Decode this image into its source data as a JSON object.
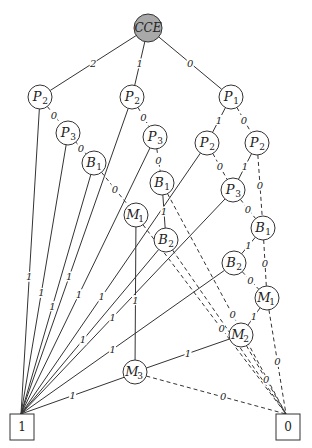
{
  "diagram": {
    "root": {
      "id": "CCE",
      "label": "CCE",
      "x": 148,
      "y": 28,
      "r": 14,
      "fill": "#a9a9a9"
    },
    "nodes": [
      {
        "id": "P2L",
        "base": "P",
        "sub": "2",
        "x": 40,
        "y": 97
      },
      {
        "id": "P2M",
        "base": "P",
        "sub": "2",
        "x": 132,
        "y": 97
      },
      {
        "id": "P1",
        "base": "P",
        "sub": "1",
        "x": 231,
        "y": 97
      },
      {
        "id": "P3L",
        "base": "P",
        "sub": "3",
        "x": 68,
        "y": 133
      },
      {
        "id": "P3M",
        "base": "P",
        "sub": "3",
        "x": 155,
        "y": 137
      },
      {
        "id": "P2a",
        "base": "P",
        "sub": "2",
        "x": 207,
        "y": 143
      },
      {
        "id": "P2b",
        "base": "P",
        "sub": "2",
        "x": 257,
        "y": 143
      },
      {
        "id": "B1L",
        "base": "B",
        "sub": "1",
        "x": 94,
        "y": 163
      },
      {
        "id": "B1M",
        "base": "B",
        "sub": "1",
        "x": 162,
        "y": 183
      },
      {
        "id": "P3R",
        "base": "P",
        "sub": "3",
        "x": 233,
        "y": 190
      },
      {
        "id": "M1L",
        "base": "M",
        "sub": "1",
        "x": 136,
        "y": 215
      },
      {
        "id": "B1R",
        "base": "B",
        "sub": "1",
        "x": 263,
        "y": 228
      },
      {
        "id": "B2M",
        "base": "B",
        "sub": "2",
        "x": 166,
        "y": 240
      },
      {
        "id": "B2R",
        "base": "B",
        "sub": "2",
        "x": 234,
        "y": 263
      },
      {
        "id": "M1R",
        "base": "M",
        "sub": "1",
        "x": 267,
        "y": 298
      },
      {
        "id": "M2",
        "base": "M",
        "sub": "2",
        "x": 241,
        "y": 335
      },
      {
        "id": "M3",
        "base": "M",
        "sub": "3",
        "x": 135,
        "y": 372
      }
    ],
    "node_radius": 12,
    "terminals": [
      {
        "id": "T1",
        "label": "1",
        "x": 22,
        "y": 427,
        "w": 24,
        "h": 26
      },
      {
        "id": "T0",
        "label": "0",
        "x": 288,
        "y": 427,
        "w": 24,
        "h": 26
      }
    ],
    "edges": [
      {
        "from": "CCE",
        "to": "P2L",
        "style": "solid",
        "label": "2"
      },
      {
        "from": "CCE",
        "to": "P2M",
        "style": "solid",
        "label": "1"
      },
      {
        "from": "CCE",
        "to": "P1",
        "style": "solid",
        "label": "0"
      },
      {
        "from": "P2L",
        "to": "T1",
        "style": "solid",
        "label": "1"
      },
      {
        "from": "P2L",
        "to": "P3L",
        "style": "dashed",
        "label": "0"
      },
      {
        "from": "P3L",
        "to": "T1",
        "style": "solid",
        "label": "1"
      },
      {
        "from": "P3L",
        "to": "B1L",
        "style": "dashed",
        "label": "0"
      },
      {
        "from": "B1L",
        "to": "T1",
        "style": "solid",
        "label": "1"
      },
      {
        "from": "B1L",
        "to": "M1L",
        "style": "dashed",
        "label": "0"
      },
      {
        "from": "P2M",
        "to": "T1",
        "style": "solid",
        "label": "1"
      },
      {
        "from": "P2M",
        "to": "P3M",
        "style": "dashed",
        "label": "0"
      },
      {
        "from": "P3M",
        "to": "T1",
        "style": "solid",
        "label": "1"
      },
      {
        "from": "P3M",
        "to": "B1M",
        "style": "dashed",
        "label": "0"
      },
      {
        "from": "B1M",
        "to": "B2M",
        "style": "solid",
        "label": "1"
      },
      {
        "from": "B1M",
        "to": "T0",
        "style": "dashed",
        "label": "0"
      },
      {
        "from": "M1L",
        "to": "M3",
        "style": "solid",
        "label": "1"
      },
      {
        "from": "M1L",
        "to": "T0",
        "style": "dashed",
        "label": "0"
      },
      {
        "from": "B2M",
        "to": "T1",
        "style": "solid",
        "label": "1"
      },
      {
        "from": "B2M",
        "to": "T0",
        "style": "dashed",
        "label": "0"
      },
      {
        "from": "P1",
        "to": "P2a",
        "style": "solid",
        "label": "1"
      },
      {
        "from": "P1",
        "to": "P2b",
        "style": "dashed",
        "label": "0"
      },
      {
        "from": "P2a",
        "to": "T1",
        "style": "solid",
        "label": "1"
      },
      {
        "from": "P2a",
        "to": "P3R",
        "style": "dashed",
        "label": "0"
      },
      {
        "from": "P2b",
        "to": "P3R",
        "style": "solid",
        "label": "1"
      },
      {
        "from": "P2b",
        "to": "B1R",
        "style": "dashed",
        "label": "0"
      },
      {
        "from": "P3R",
        "to": "T1",
        "style": "solid",
        "label": "1"
      },
      {
        "from": "P3R",
        "to": "B1R",
        "style": "dashed",
        "label": "0"
      },
      {
        "from": "B1R",
        "to": "B2R",
        "style": "solid",
        "label": "1"
      },
      {
        "from": "B1R",
        "to": "M1R",
        "style": "dashed",
        "label": "0"
      },
      {
        "from": "B2R",
        "to": "T1",
        "style": "solid",
        "label": "1"
      },
      {
        "from": "B2R",
        "to": "M1R",
        "style": "dashed",
        "label": "0"
      },
      {
        "from": "M1R",
        "to": "M2",
        "style": "solid",
        "label": "1"
      },
      {
        "from": "M1R",
        "to": "T0",
        "style": "dashed",
        "label": "0"
      },
      {
        "from": "M2",
        "to": "M3",
        "style": "solid",
        "label": "1"
      },
      {
        "from": "M2",
        "to": "T0",
        "style": "dashed",
        "label": "0"
      },
      {
        "from": "M3",
        "to": "T1",
        "style": "solid",
        "label": "1"
      },
      {
        "from": "M3",
        "to": "T0",
        "style": "dashed",
        "label": "0"
      }
    ]
  }
}
